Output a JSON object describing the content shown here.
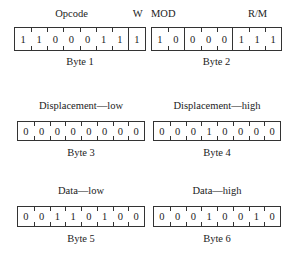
{
  "bytes": [
    {
      "label": "Byte 1",
      "fields": [
        {
          "name": "Opcode",
          "bits": 7
        },
        {
          "name": "W",
          "bits": 1
        }
      ],
      "bits": [
        "1",
        "1",
        "0",
        "0",
        "0",
        "1",
        "1",
        "1"
      ]
    },
    {
      "label": "Byte 2",
      "fields": [
        {
          "name": "MOD",
          "bits": 2
        },
        {
          "name": "",
          "bits": 3
        },
        {
          "name": "R/M",
          "bits": 3
        }
      ],
      "bits": [
        "1",
        "0",
        "0",
        "0",
        "0",
        "1",
        "1",
        "1"
      ]
    },
    {
      "label": "Byte 3",
      "fields": [
        {
          "name": "Displacement—low",
          "bits": 8
        }
      ],
      "bits": [
        "0",
        "0",
        "0",
        "0",
        "0",
        "0",
        "0",
        "0"
      ]
    },
    {
      "label": "Byte 4",
      "fields": [
        {
          "name": "Displacement—high",
          "bits": 8
        }
      ],
      "bits": [
        "0",
        "0",
        "0",
        "1",
        "0",
        "0",
        "0",
        "0"
      ]
    },
    {
      "label": "Byte 5",
      "fields": [
        {
          "name": "Data—low",
          "bits": 8
        }
      ],
      "bits": [
        "0",
        "0",
        "1",
        "1",
        "0",
        "1",
        "0",
        "0"
      ]
    },
    {
      "label": "Byte 6",
      "fields": [
        {
          "name": "Data—high",
          "bits": 8
        }
      ],
      "bits": [
        "0",
        "0",
        "0",
        "1",
        "0",
        "0",
        "1",
        "0"
      ]
    }
  ]
}
